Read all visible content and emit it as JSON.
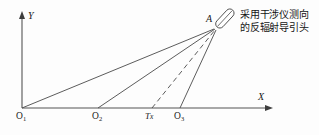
{
  "figure": {
    "type": "geometry-diagram"
  },
  "axes": {
    "y_label": "Y",
    "x_label": "X",
    "origin_x": 22,
    "origin_y": 108,
    "x_arrow_tip": 272,
    "y_arrow_tip": 12
  },
  "points": [
    {
      "id": "O1",
      "label_main": "O",
      "label_sub": "1",
      "x": 22,
      "y": 108
    },
    {
      "id": "O2",
      "label_main": "O",
      "label_sub": "2",
      "x": 98,
      "y": 108
    },
    {
      "id": "Tx",
      "label_main": "T",
      "label_sub": "x",
      "x": 152,
      "y": 108
    },
    {
      "id": "O3",
      "label_main": "O",
      "label_sub": "3",
      "x": 180,
      "y": 108
    }
  ],
  "target": {
    "id": "A",
    "label": "A",
    "x": 216,
    "y": 28
  },
  "rays": [
    {
      "from": "O1",
      "to": "A",
      "style": "solid"
    },
    {
      "from": "O2",
      "to": "A",
      "style": "solid"
    },
    {
      "from": "Tx",
      "to": "A",
      "style": "dashed"
    },
    {
      "from": "O3",
      "to": "A",
      "style": "solid"
    }
  ],
  "annotation": {
    "line1": "采用干涉仪测向",
    "line2": "的反辐射导引头",
    "full_text": "采用干涉仪测向的反辐射导引头"
  },
  "icon": {
    "name": "seeker-head-icon",
    "shape": "tilted-rounded-rectangle"
  },
  "colors": {
    "background": "#fdfdfd",
    "line": "#4a4a4a",
    "axis": "#555555",
    "text": "#141414"
  }
}
